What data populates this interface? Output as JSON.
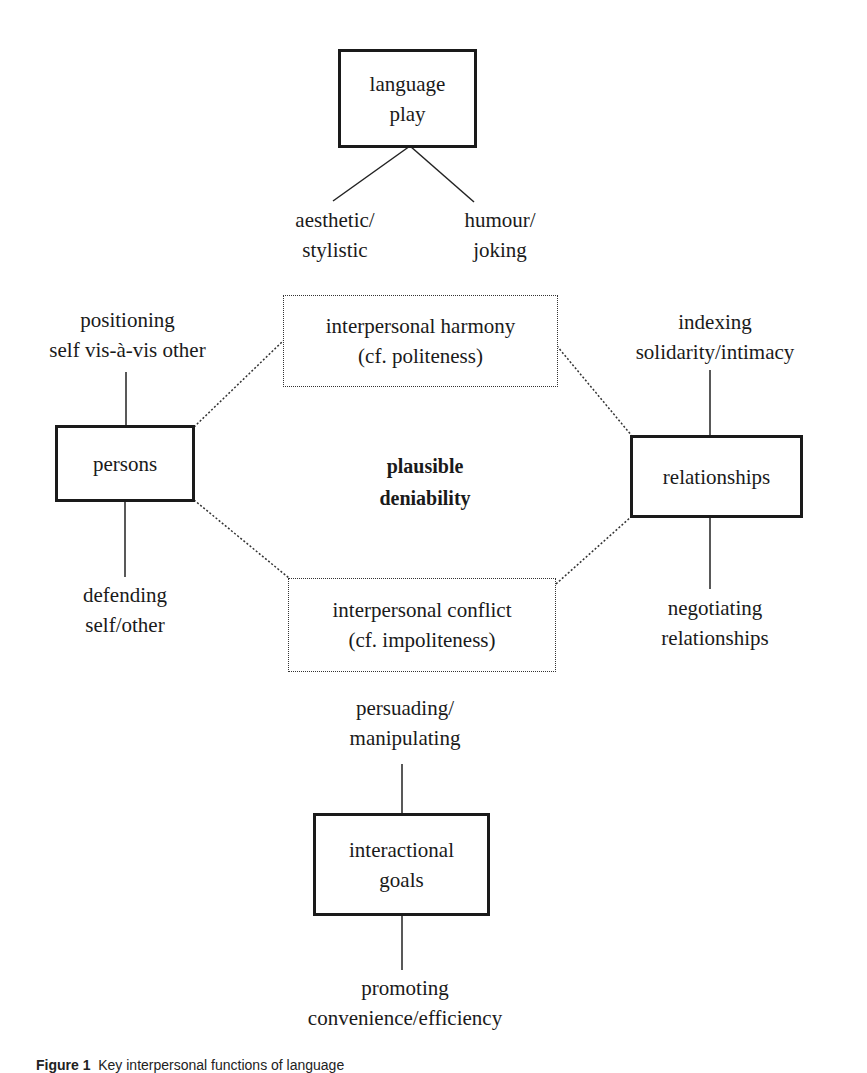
{
  "diagram": {
    "center_label": [
      "plausible",
      "deniability"
    ],
    "nodes": {
      "language_play": {
        "lines": [
          "language",
          "play"
        ],
        "style": "solid"
      },
      "persons": {
        "lines": [
          "persons"
        ],
        "style": "solid"
      },
      "relationships": {
        "lines": [
          "relationships"
        ],
        "style": "solid"
      },
      "interactional_goals": {
        "lines": [
          "interactional",
          "goals"
        ],
        "style": "solid"
      },
      "harmony": {
        "lines": [
          "interpersonal harmony",
          "(cf. politeness)"
        ],
        "style": "dotted"
      },
      "conflict": {
        "lines": [
          "interpersonal conflict",
          "(cf. impoliteness)"
        ],
        "style": "dotted"
      }
    },
    "leaves": {
      "aesthetic": [
        "aesthetic/",
        "stylistic"
      ],
      "humour": [
        "humour/",
        "joking"
      ],
      "positioning": [
        "positioning",
        "self vis-à-vis other"
      ],
      "defending": [
        "defending",
        "self/other"
      ],
      "indexing": [
        "indexing",
        "solidarity/intimacy"
      ],
      "negotiating": [
        "negotiating",
        "relationships"
      ],
      "persuading": [
        "persuading/",
        "manipulating"
      ],
      "promoting": [
        "promoting",
        "convenience/efficiency"
      ]
    }
  },
  "caption": {
    "figure_label": "Figure 1",
    "text": "Key interpersonal functions of language"
  }
}
